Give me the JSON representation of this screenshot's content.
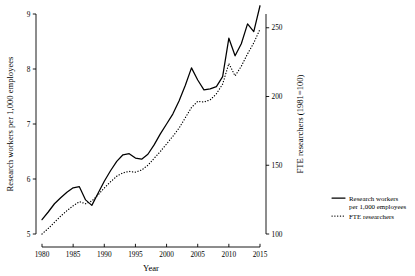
{
  "chart_data": {
    "type": "line",
    "title": "",
    "xlabel": "Year",
    "ylabel": "Research workers per 1,000 employees",
    "y2label": "FTE researchers (1981=100)",
    "xlim": [
      1980,
      2015
    ],
    "ylim": [
      5,
      9
    ],
    "y2lim": [
      100,
      260
    ],
    "xticks": [
      1980,
      1985,
      1990,
      1995,
      2000,
      2005,
      2010,
      2015
    ],
    "xtick_labels": [
      "1980",
      "1985",
      "1990",
      "1995",
      "2000",
      "2005",
      "2010",
      "2015"
    ],
    "yticks": [
      5,
      6,
      7,
      8,
      9
    ],
    "ytick_labels": [
      "5",
      "6",
      "7",
      "8",
      "9"
    ],
    "y2ticks": [
      100,
      150,
      200,
      250
    ],
    "y2tick_labels": [
      "100",
      "150",
      "200",
      "250"
    ],
    "grid": false,
    "legend_position": "right",
    "x": [
      1980,
      1981,
      1982,
      1983,
      1984,
      1985,
      1986,
      1987,
      1988,
      1989,
      1990,
      1991,
      1992,
      1993,
      1994,
      1995,
      1996,
      1997,
      1998,
      1999,
      2000,
      2001,
      2002,
      2003,
      2004,
      2005,
      2006,
      2007,
      2008,
      2009,
      2010,
      2011,
      2012,
      2013,
      2014,
      2015
    ],
    "series": [
      {
        "name": "Research workers per 1,000 employees",
        "axis": "left",
        "style": "solid",
        "color": "#000000",
        "values": [
          5.26,
          5.4,
          5.55,
          5.66,
          5.76,
          5.84,
          5.86,
          5.62,
          5.52,
          5.74,
          5.96,
          6.15,
          6.32,
          6.44,
          6.46,
          6.38,
          6.36,
          6.45,
          6.62,
          6.82,
          7.0,
          7.18,
          7.42,
          7.7,
          8.02,
          7.8,
          7.62,
          7.64,
          7.68,
          7.86,
          8.56,
          8.24,
          8.46,
          8.82,
          8.68,
          9.15
        ]
      },
      {
        "name": "FTE researchers",
        "axis": "right",
        "style": "dotted",
        "color": "#000000",
        "values": [
          100.0,
          104.0,
          108.5,
          113.0,
          117.0,
          120.5,
          123.5,
          122.0,
          124.0,
          128.5,
          133.5,
          138.0,
          142.0,
          144.5,
          145.5,
          145.0,
          146.5,
          150.0,
          155.0,
          160.0,
          165.5,
          171.0,
          177.0,
          184.5,
          192.0,
          196.5,
          196.0,
          197.5,
          202.0,
          209.0,
          224.0,
          215.0,
          222.0,
          231.0,
          239.0,
          249.0
        ]
      }
    ],
    "legend": [
      {
        "label_line1": "Research workers",
        "label_line2": "per 1,000 employees",
        "style": "solid"
      },
      {
        "label_line1": "FTE researchers",
        "label_line2": "",
        "style": "dotted"
      }
    ]
  }
}
